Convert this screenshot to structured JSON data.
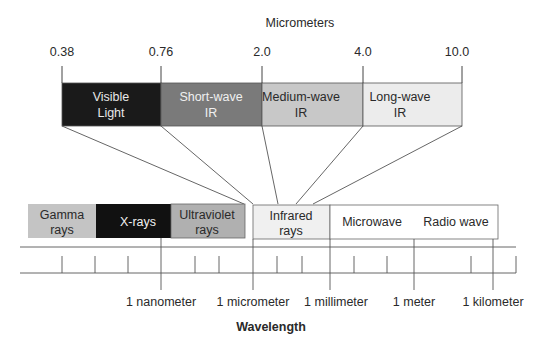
{
  "top_scale": {
    "title": "Micrometers",
    "ticks": [
      {
        "label": "0.38",
        "x": 62
      },
      {
        "label": "0.76",
        "x": 161
      },
      {
        "label": "2.0",
        "x": 262
      },
      {
        "label": "4.0",
        "x": 363
      },
      {
        "label": "10.0",
        "x": 462
      }
    ],
    "bands": [
      {
        "name": "visible-light",
        "line1": "Visible",
        "line2": "Light",
        "x1": 62,
        "x2": 161,
        "fill": "#1a1a1a",
        "text_color": "#e8e8e8"
      },
      {
        "name": "short-wave-ir",
        "line1": "Short-wave",
        "line2": "IR",
        "x1": 161,
        "x2": 262,
        "fill": "#7a7a7a",
        "text_color": "#f0f0f0"
      },
      {
        "name": "medium-wave-ir",
        "line1": "Medium-wave",
        "line2": "IR",
        "x1": 262,
        "x2": 363,
        "fill": "#c8c8c8",
        "text_color": "#2a2a2a"
      },
      {
        "name": "long-wave-ir",
        "line1": "Long-wave",
        "line2": "IR",
        "x1": 363,
        "x2": 462,
        "fill": "#ececec",
        "text_color": "#2a2a2a"
      }
    ]
  },
  "spectrum": {
    "bands": [
      {
        "name": "gamma-rays",
        "line1": "Gamma",
        "line2": "rays",
        "x1": 28,
        "x2": 96,
        "fill": "#c4c4c4",
        "text_color": "#2a2a2a"
      },
      {
        "name": "x-rays",
        "line1": "X-rays",
        "line2": "",
        "x1": 96,
        "x2": 171,
        "fill": "#111111",
        "text_color": "#f0f0f0"
      },
      {
        "name": "ultraviolet-rays",
        "line1": "Ultraviolet",
        "line2": "rays",
        "x1": 171,
        "x2": 245,
        "fill": "#b0b0b0",
        "text_color": "#2a2a2a"
      },
      {
        "name": "infrared-rays",
        "line1": "Infrared",
        "line2": "rays",
        "x1": 253,
        "x2": 330,
        "fill": "#f0f0f0",
        "text_color": "#2a2a2a"
      },
      {
        "name": "microwave",
        "line1": "Microwave",
        "line2": "",
        "x1": 330,
        "x2": 414,
        "fill": "#ffffff",
        "text_color": "#2a2a2a"
      },
      {
        "name": "radio-wave",
        "line1": "Radio wave",
        "line2": "",
        "x1": 414,
        "x2": 498,
        "fill": "#ffffff",
        "text_color": "#2a2a2a"
      }
    ],
    "minor_ticks": [
      62,
      95,
      128,
      195,
      219,
      277,
      302,
      354,
      387,
      471,
      516
    ],
    "major_ticks": [
      {
        "label": "1 nanometer",
        "x": 161
      },
      {
        "label": "1 micrometer",
        "x": 253
      },
      {
        "label": "1 millimeter",
        "x": 330
      },
      {
        "label": "1 meter",
        "x": 414
      },
      {
        "label": "1 kilometer",
        "x": 493
      }
    ],
    "axis_title": "Wavelength"
  }
}
